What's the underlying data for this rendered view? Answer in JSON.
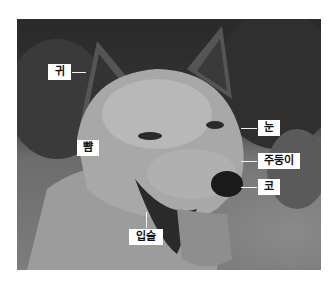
{
  "figure": {
    "type": "annotated-photo",
    "labels": [
      {
        "id": "ear",
        "text": "귀"
      },
      {
        "id": "cheek",
        "text": "뺨"
      },
      {
        "id": "eye",
        "text": "눈"
      },
      {
        "id": "muzzle",
        "text": "주둥이"
      },
      {
        "id": "nose",
        "text": "코"
      },
      {
        "id": "lips",
        "text": "입술"
      }
    ]
  }
}
